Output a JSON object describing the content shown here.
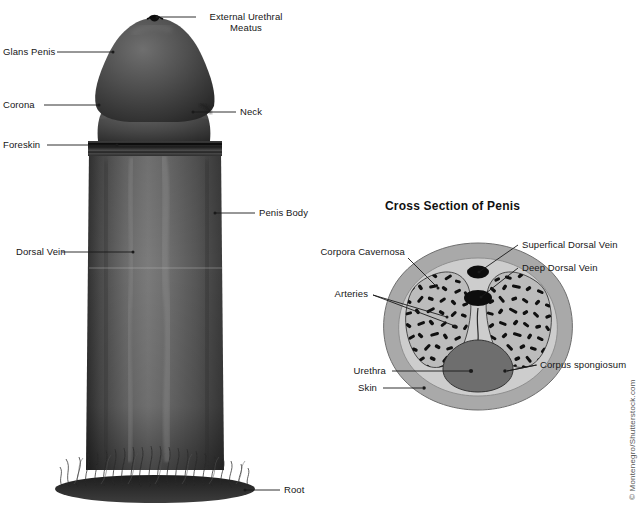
{
  "figure": {
    "credit": "© Montenegro/Shutterstock.com",
    "photo_labels": [
      {
        "key": "external_urethral_meatus",
        "text": "External Urethral\nMeatus",
        "line1": "External Urethral",
        "line2": "Meatus"
      },
      {
        "key": "glans_penis",
        "text": "Glans Penis"
      },
      {
        "key": "corona",
        "text": "Corona"
      },
      {
        "key": "foreskin",
        "text": "Foreskin"
      },
      {
        "key": "dorsal_vein",
        "text": "Dorsal Vein"
      },
      {
        "key": "neck",
        "text": "Neck"
      },
      {
        "key": "penis_body",
        "text": "Penis Body"
      },
      {
        "key": "root",
        "text": "Root"
      }
    ]
  },
  "cross_section": {
    "title": "Cross Section of Penis",
    "labels": [
      {
        "key": "corpora_cavernosa",
        "text": "Corpora Cavernosa"
      },
      {
        "key": "arteries",
        "text": "Arteries"
      },
      {
        "key": "urethra",
        "text": "Urethra"
      },
      {
        "key": "skin",
        "text": "Skin"
      },
      {
        "key": "superficial_dorsal_vein",
        "text": "Superfical Dorsal Vein"
      },
      {
        "key": "deep_dorsal_vein",
        "text": "Deep Dorsal Vein"
      },
      {
        "key": "corpus_spongiosum",
        "text": "Corpus spongiosum"
      }
    ]
  },
  "colors": {
    "background": "#ffffff",
    "leader_line": "#1a1a1a",
    "text": "#161616",
    "skin_layer": "#a8a8a8",
    "fascia_layer": "#cfcfcf",
    "cavernosa_fill": "#b9b9b9",
    "cavernosa_trabecula": "#101010",
    "spongiosum_fill": "#6e6e6e",
    "vein_fill": "#0d0d0d",
    "photo_dark": "#3a3a3a",
    "photo_mid": "#5e5e5e",
    "photo_light": "#8a8a8a"
  }
}
